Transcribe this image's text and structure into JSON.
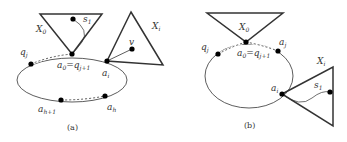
{
  "figure": {
    "panels": [
      {
        "id": "a",
        "caption": "(a)",
        "labels": {
          "X0": "X",
          "X0_sub": "0",
          "Xi": "X",
          "Xi_sub": "i",
          "s1": "s",
          "s1_sub": "1",
          "v": "v",
          "qj": "q",
          "qj_sub": "j",
          "a0": "a",
          "a0_sub": "0",
          "eq": "=",
          "qj1": "q",
          "qj1_sub": "j+1",
          "ai": "a",
          "ai_sub": "i",
          "ah1": "a",
          "ah1_sub": "h+1",
          "ah": "a",
          "ah_sub": "h"
        }
      },
      {
        "id": "b",
        "caption": "(b)",
        "labels": {
          "X0": "X",
          "X0_sub": "0",
          "Xi": "X",
          "Xi_sub": "i",
          "s1": "s",
          "s1_sub": "1",
          "qj": "q",
          "qj_sub": "j",
          "a0": "a",
          "a0_sub": "0",
          "eq": "=",
          "qj1": "q",
          "qj1_sub": "j+1",
          "aj": "a",
          "aj_sub": "j",
          "ai": "a",
          "ai_sub": "i"
        }
      }
    ],
    "colors": {
      "stroke": "#333333",
      "node": "#000000"
    }
  }
}
